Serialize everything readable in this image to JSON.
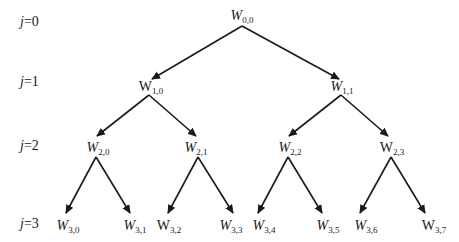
{
  "levels": [
    {
      "var": "j",
      "value": "0"
    },
    {
      "var": "j",
      "value": "1"
    },
    {
      "var": "j",
      "value": "2"
    },
    {
      "var": "j",
      "value": "3"
    }
  ],
  "nodes": {
    "n00": {
      "base": "W",
      "sub": "0,0",
      "italic": true
    },
    "n10": {
      "base": "W",
      "sub": "1,0",
      "italic": false
    },
    "n11": {
      "base": "W",
      "sub": "1,1",
      "italic": true
    },
    "n20": {
      "base": "W",
      "sub": "2,0",
      "italic": true
    },
    "n21": {
      "base": "W",
      "sub": "2,1",
      "italic": true
    },
    "n22": {
      "base": "W",
      "sub": "2,2",
      "italic": true
    },
    "n23": {
      "base": "W",
      "sub": "2,3",
      "italic": false
    },
    "n30": {
      "base": "W",
      "sub": "3,0",
      "italic": true
    },
    "n31": {
      "base": "W",
      "sub": "3,1",
      "italic": true
    },
    "n32": {
      "base": "W",
      "sub": "3,2",
      "italic": false
    },
    "n33": {
      "base": "W",
      "sub": "3,3",
      "italic": true
    },
    "n34": {
      "base": "W",
      "sub": "3,4",
      "italic": true
    },
    "n35": {
      "base": "W",
      "sub": "3,5",
      "italic": true
    },
    "n36": {
      "base": "W",
      "sub": "3,6",
      "italic": true
    },
    "n37": {
      "base": "W",
      "sub": "3,7",
      "italic": false
    }
  },
  "edges": [
    [
      "W0,0",
      "W1,0"
    ],
    [
      "W0,0",
      "W1,1"
    ],
    [
      "W1,0",
      "W2,0"
    ],
    [
      "W1,0",
      "W2,1"
    ],
    [
      "W1,1",
      "W2,2"
    ],
    [
      "W1,1",
      "W2,3"
    ],
    [
      "W2,0",
      "W3,0"
    ],
    [
      "W2,0",
      "W3,1"
    ],
    [
      "W2,1",
      "W3,2"
    ],
    [
      "W2,1",
      "W3,3"
    ],
    [
      "W2,2",
      "W3,4"
    ],
    [
      "W2,2",
      "W3,5"
    ],
    [
      "W2,3",
      "W3,6"
    ],
    [
      "W2,3",
      "W3,7"
    ]
  ]
}
